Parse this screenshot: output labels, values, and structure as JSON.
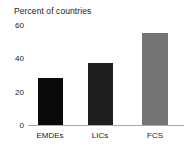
{
  "chart_data": {
    "type": "bar",
    "title": "Percent of countries",
    "xlabel": "",
    "ylabel": "",
    "categories": [
      "EMDEs",
      "LICs",
      "FCS"
    ],
    "values": [
      28,
      37,
      55
    ],
    "colors": [
      "#0a0a0a",
      "#1f1f1f",
      "#757575"
    ],
    "ylim": [
      0,
      60
    ],
    "yticks": [
      0,
      20,
      40,
      60
    ],
    "ytick_labels": [
      "0",
      "20",
      "40",
      "60"
    ],
    "grid": false,
    "legend": "none"
  },
  "axis": {
    "tick0": "0",
    "tick1": "20",
    "tick2": "40",
    "tick3": "60"
  },
  "categories": {
    "c0": "EMDEs",
    "c1": "LICs",
    "c2": "FCS"
  }
}
